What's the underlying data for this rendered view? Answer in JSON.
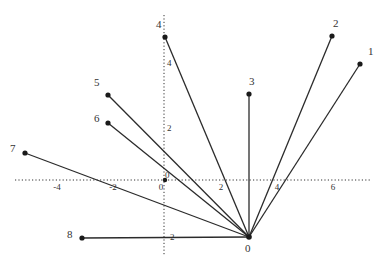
{
  "diagram": {
    "title": "",
    "axes": {
      "x_ticks": [
        {
          "label": "-4",
          "x": 57,
          "y": 190
        },
        {
          "label": "-2",
          "x": 113,
          "y": 190
        },
        {
          "label": "0",
          "x": 161,
          "y": 190
        },
        {
          "label": "2",
          "x": 221,
          "y": 190
        },
        {
          "label": "4",
          "x": 277,
          "y": 190
        },
        {
          "label": "6",
          "x": 333,
          "y": 190
        }
      ],
      "y_ticks": [
        {
          "label": "4",
          "x": 167,
          "y": 66
        },
        {
          "label": "2",
          "x": 167,
          "y": 131
        },
        {
          "label": "-2",
          "x": 167,
          "y": 240
        }
      ]
    },
    "hub": {
      "label": "0",
      "x": 249,
      "y": 237,
      "label_x": 245,
      "label_y": 252
    },
    "origin_marker": {
      "label": "0",
      "x": 165,
      "y": 180,
      "label_x": 165,
      "label_y": 178
    },
    "points": [
      {
        "label": "1",
        "x": 360,
        "y": 64,
        "label_x": 368,
        "label_y": 55
      },
      {
        "label": "2",
        "x": 332,
        "y": 36,
        "label_x": 333,
        "label_y": 27
      },
      {
        "label": "3",
        "x": 249,
        "y": 94,
        "label_x": 249,
        "label_y": 85
      },
      {
        "label": "4",
        "x": 165,
        "y": 37,
        "label_x": 156,
        "label_y": 28
      },
      {
        "label": "5",
        "x": 108,
        "y": 95,
        "label_x": 94,
        "label_y": 86
      },
      {
        "label": "6",
        "x": 108,
        "y": 123,
        "label_x": 94,
        "label_y": 122
      },
      {
        "label": "7",
        "x": 25,
        "y": 153,
        "label_x": 10,
        "label_y": 152
      },
      {
        "label": "8",
        "x": 82,
        "y": 238,
        "label_x": 67,
        "label_y": 238
      }
    ]
  }
}
